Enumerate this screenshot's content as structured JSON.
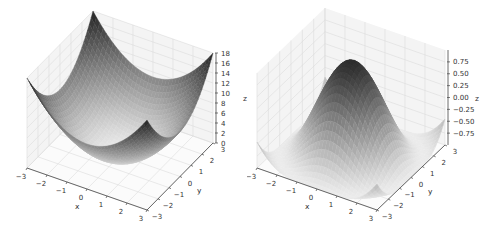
{
  "chart_data": [
    {
      "type": "surface3d",
      "title": "",
      "function": "z = x^2 + y^2",
      "xlabel": "x",
      "ylabel": "y",
      "zlabel": "z",
      "xlim": [
        -3,
        3
      ],
      "ylim": [
        -3,
        3
      ],
      "zlim": [
        0,
        18
      ],
      "x_ticks": [
        "-3",
        "-2",
        "-1",
        "0",
        "1",
        "2",
        "3"
      ],
      "y_ticks": [
        "-3",
        "-2",
        "-1",
        "0",
        "1",
        "2",
        "3"
      ],
      "z_ticks": [
        "0",
        "2",
        "4",
        "6",
        "8",
        "10",
        "12",
        "14",
        "16",
        "18"
      ],
      "colormap": "gray",
      "grid": true,
      "projection": {
        "origin_x_min_y_min_z0": [
          27,
          168
        ],
        "x_vec": [
          120,
          42
        ],
        "y_vec": [
          66,
          -67
        ],
        "z_scale_px_per_unit": 5.0,
        "z_axis_x": 213
      }
    },
    {
      "type": "surface3d",
      "title": "",
      "function": "z = cos(sqrt(x^2 + y^2))",
      "xlabel": "x",
      "ylabel": "y",
      "zlabel": "z",
      "xlim": [
        -3,
        3
      ],
      "ylim": [
        -3,
        3
      ],
      "zlim": [
        -1,
        1
      ],
      "x_ticks": [
        "-3",
        "-2",
        "-1",
        "0",
        "1",
        "2",
        "3"
      ],
      "y_ticks": [
        "-3",
        "-2",
        "-1",
        "0",
        "1",
        "2",
        "3"
      ],
      "z_ticks": [
        "0.75",
        "0.50",
        "0.25",
        "0.00",
        "-0.25",
        "-0.50",
        "-0.75"
      ],
      "colormap": "gray",
      "grid": true,
      "projection": {
        "origin_x_min_y_min_z0": [
          10,
          168
        ],
        "x_vec": [
          120,
          42
        ],
        "y_vec": [
          68,
          -65
        ],
        "z_scale_px_per_unit": 47.5,
        "z_axis_x": 202
      }
    }
  ],
  "left": {
    "xlabel": "x",
    "ylabel": "y",
    "zlabel": "z"
  },
  "right": {
    "xlabel": "x",
    "ylabel": "y",
    "zlabel": "z"
  }
}
